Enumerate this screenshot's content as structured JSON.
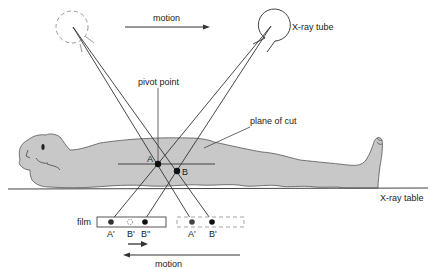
{
  "diagram": {
    "labels": {
      "motion_top": "motion",
      "xray_tube": "X-ray tube",
      "pivot_point": "pivot point",
      "plane_of_cut": "plane of cut",
      "point_a": "A",
      "point_b": "B",
      "xray_table": "X-ray table",
      "film": "film",
      "film_a_prime": "A'",
      "film_b_prime": "B'",
      "film_b_double_prime": "B''",
      "film_ghost_a_prime": "A'",
      "film_ghost_b_prime": "B'",
      "motion_bottom": "motion"
    },
    "colors": {
      "body_fill": "#c8c8c8",
      "line": "#333333",
      "dashed": "#888888",
      "text": "#222222"
    }
  }
}
